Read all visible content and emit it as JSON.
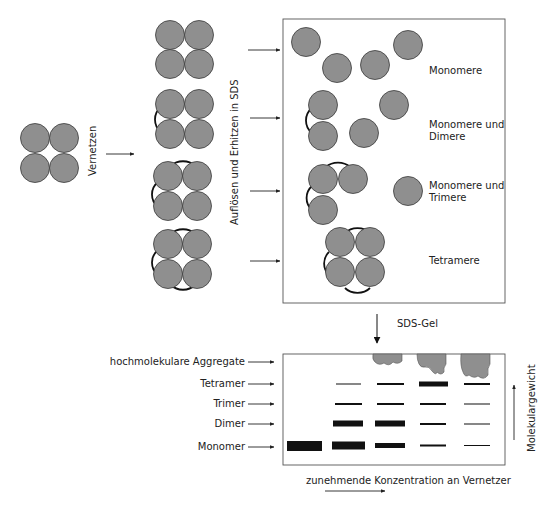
{
  "diagram": {
    "step1_label": "Vernetzen",
    "step2_label": "Auflösen und Erhitzen in SDS",
    "step3_label": "SDS-Gel",
    "results": [
      {
        "label_line1": "Monomere",
        "label_line2": ""
      },
      {
        "label_line1": "Monomere und",
        "label_line2": "Dimere"
      },
      {
        "label_line1": "Monomere und",
        "label_line2": "Trimere"
      },
      {
        "label_line1": "Tetramere",
        "label_line2": ""
      }
    ],
    "gel": {
      "row_labels": [
        "hochmolekulare Aggregate",
        "Tetramer",
        "Trimer",
        "Dimer",
        "Monomer"
      ],
      "x_axis_label": "zunehmende Konzentration an Vernetzer",
      "y_axis_label": "Molekulargewicht",
      "lanes": 5,
      "band_intensity": {
        "Tetramer": [
          0,
          1,
          2,
          4,
          2
        ],
        "Trimer": [
          0,
          2,
          2,
          2,
          1
        ],
        "Dimer": [
          0,
          4,
          4,
          2,
          1
        ],
        "Monomer": [
          5,
          4,
          3,
          2,
          1
        ],
        "Aggregate": [
          0,
          0,
          1,
          2,
          3
        ]
      }
    },
    "colors": {
      "subunit_fill": "#8f8f8f",
      "band": "#111111",
      "frame": "#555555"
    }
  }
}
